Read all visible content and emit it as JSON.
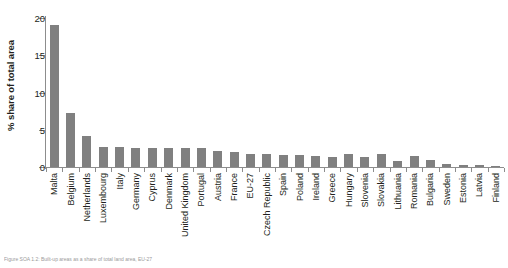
{
  "chart_data": {
    "type": "bar",
    "title": "",
    "xlabel": "",
    "ylabel": "% share of total area",
    "ylim": [
      0,
      20
    ],
    "yticks": [
      0,
      5,
      10,
      15,
      20
    ],
    "grid": false,
    "legend": false,
    "bar_color": "#808080",
    "axis_color": "#8d8d8d",
    "categories": [
      "Malta",
      "Belgium",
      "Netherlands",
      "Luxembourg",
      "Italy",
      "Germany",
      "Cyprus",
      "Denmark",
      "United Kingdom",
      "Portugal",
      "Austria",
      "France",
      "EU-27",
      "Czech Republic",
      "Spain",
      "Poland",
      "Ireland",
      "Greece",
      "Hungary",
      "Slovenia",
      "Slovakia",
      "Lithuania",
      "Romania",
      "Bulgaria",
      "Sweden",
      "Estonia",
      "Latvia",
      "Finland"
    ],
    "values": [
      19.0,
      7.2,
      4.2,
      2.7,
      2.7,
      2.6,
      2.6,
      2.6,
      2.5,
      2.5,
      2.1,
      2.0,
      1.8,
      1.7,
      1.6,
      1.6,
      1.5,
      1.4,
      1.7,
      1.3,
      1.7,
      0.8,
      1.5,
      1.0,
      0.4,
      0.3,
      0.3,
      0.2
    ]
  },
  "caption": {
    "text": "Figure SOA 1.2: Built-up areas as a share of total land area, EU-27"
  }
}
